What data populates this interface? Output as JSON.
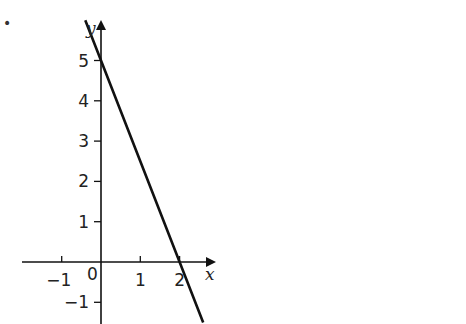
{
  "bullet": "•",
  "chart_data": {
    "type": "line",
    "title": "",
    "xlabel": "x",
    "ylabel": "y",
    "xlim": [
      -1.9,
      2.9
    ],
    "ylim": [
      -1.6,
      6.1
    ],
    "grid": false,
    "legend": null,
    "x_ticks": [
      -1,
      1,
      2
    ],
    "x_tick_labels": [
      "−1",
      "1",
      "2"
    ],
    "y_ticks": [
      -1,
      1,
      2,
      3,
      4,
      5
    ],
    "y_tick_labels": [
      "−1",
      "1",
      "2",
      "3",
      "4",
      "5"
    ],
    "origin_label": "0",
    "series": [
      {
        "name": "y = 5 − 2.5x",
        "equation": "y = -2.5x + 5",
        "x": [
          -0.4,
          0,
          1,
          2,
          2.6
        ],
        "y": [
          6,
          5,
          2.5,
          0,
          -1.5
        ]
      }
    ],
    "intercepts": {
      "x_intercept": 2,
      "y_intercept": 5
    }
  }
}
